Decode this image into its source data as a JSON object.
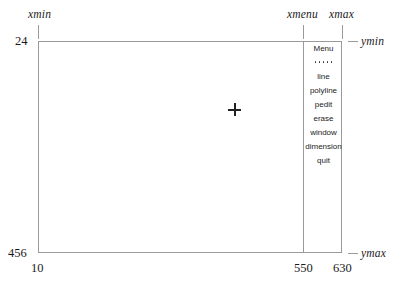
{
  "diagram": {
    "background_color": "#ffffff",
    "line_color": "#9a9a9a",
    "text_color": "#1a1a1a"
  },
  "axis_labels": {
    "xmin": "xmin",
    "xmenu": "xmenu",
    "xmax": "xmax",
    "ymin": "ymin",
    "ymax": "ymax"
  },
  "coordinate_values": {
    "top_left_y": "24",
    "bottom_left_y": "456",
    "bottom_left_x": "10",
    "bottom_menu_x": "550",
    "bottom_right_x": "630"
  },
  "menu": {
    "header": "Menu",
    "separator": "• • • • •",
    "items": [
      {
        "label": "line"
      },
      {
        "label": "polyline"
      },
      {
        "label": "pedit"
      },
      {
        "label": "erase"
      },
      {
        "label": "window"
      },
      {
        "label": "dimension"
      },
      {
        "label": "quit"
      }
    ]
  },
  "cursor": {
    "icon": "crosshair-icon",
    "x": 234,
    "y": 109
  }
}
